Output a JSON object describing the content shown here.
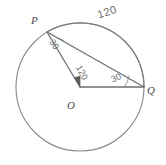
{
  "figure": {
    "type": "circle-geometry-diagram",
    "background_color": "#ffffff",
    "stroke_color": "#6b6b6b",
    "text_color": "#4a4a4a"
  },
  "circle": {
    "center_label": "O",
    "center_x": 80,
    "center_y": 87,
    "radius": 64
  },
  "points": {
    "p_label": "P",
    "p_x": 47,
    "p_y": 32,
    "q_label": "Q",
    "q_x": 144,
    "q_y": 87
  },
  "segments": [
    {
      "name": "radius-op",
      "from": "O",
      "to": "P"
    },
    {
      "name": "radius-oq",
      "from": "O",
      "to": "Q"
    },
    {
      "name": "chord-pq",
      "from": "P",
      "to": "Q"
    }
  ],
  "measures": {
    "arc_pq": "120",
    "angle_at_p": "30",
    "angle_at_o": "120",
    "angle_at_q": "30"
  }
}
